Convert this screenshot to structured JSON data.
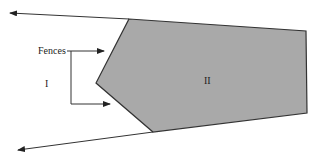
{
  "diagram": {
    "labels": {
      "fences": "Fences",
      "region_outside": "I",
      "region_inside": "II"
    },
    "colors": {
      "polygon_fill": "#a9a9a9",
      "stroke": "#333333",
      "background": "#ffffff"
    },
    "polygon_vertices": [
      [
        129,
        19
      ],
      [
        306,
        31
      ],
      [
        307,
        113
      ],
      [
        153,
        132
      ],
      [
        96,
        83
      ]
    ],
    "arrows": [
      {
        "name": "upper-boundary-ray",
        "from": [
          129,
          19
        ],
        "to": [
          9,
          13
        ]
      },
      {
        "name": "lower-boundary-ray",
        "from": [
          153,
          132
        ],
        "to": [
          17,
          150
        ]
      },
      {
        "name": "fence-pointer-top",
        "from": [
          71,
          51
        ],
        "to": [
          104,
          51
        ]
      },
      {
        "name": "fence-pointer-bottom",
        "from": [
          71,
          104
        ],
        "to": [
          110,
          104
        ]
      }
    ]
  }
}
